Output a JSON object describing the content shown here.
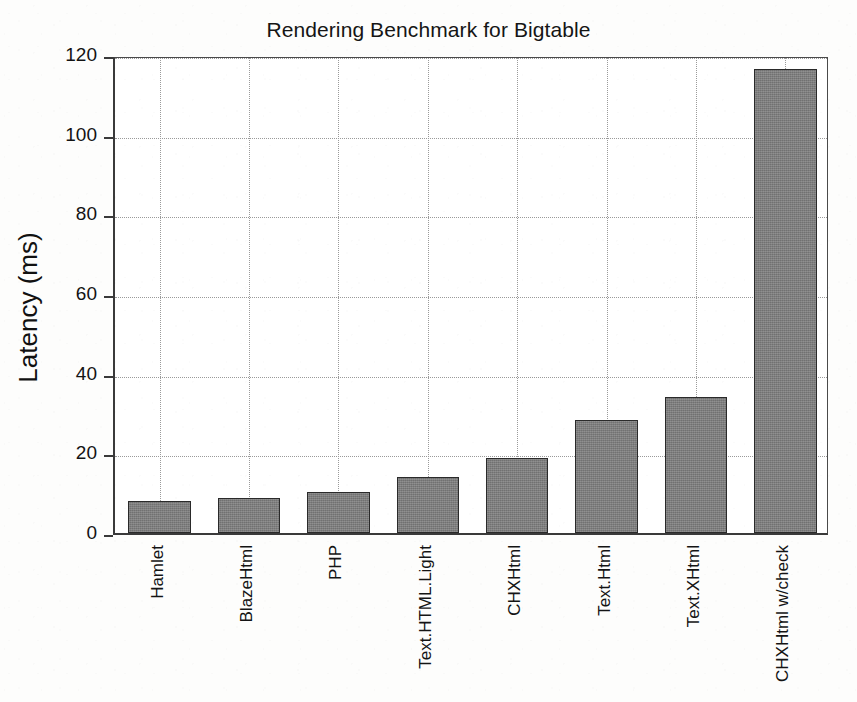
{
  "chart_data": {
    "type": "bar",
    "title": "Rendering Benchmark for Bigtable",
    "xlabel": "",
    "ylabel": "Latency (ms)",
    "categories": [
      "Hamlet",
      "BlazeHtml",
      "PHP",
      "Text.HTML.Light",
      "CHXHtml",
      "Text.Html",
      "Text.XHtml",
      "CHXHtml w/check"
    ],
    "values": [
      8,
      8.8,
      10.3,
      14,
      18.8,
      28.3,
      34.2,
      116.5
    ],
    "ylim": [
      0,
      120
    ],
    "yticks": [
      0,
      20,
      40,
      60,
      80,
      100,
      120
    ],
    "ytick_labels": [
      "0",
      "20",
      "40",
      "60",
      "80",
      "100",
      "120"
    ],
    "grid": true,
    "grid_style": "dotted",
    "legend": false,
    "bar_color": "#7d7d7d",
    "bar_edge_color": "#2a2a2a",
    "axis_color": "#3a3a3a",
    "background_color": "#ffffff",
    "xtick_label_rotation": -90
  }
}
